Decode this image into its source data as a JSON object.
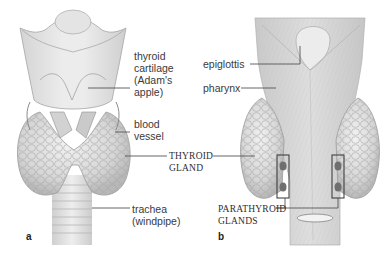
{
  "figure": {
    "panels": [
      {
        "id": "a",
        "letter": "a",
        "view": "anterior",
        "labels": {
          "thyroid_cartilage": "thyroid\ncartilage\n(Adam's\napple)",
          "blood_vessel": "blood\nvessel",
          "trachea": "trachea\n(windpipe)"
        }
      },
      {
        "id": "b",
        "letter": "b",
        "view": "posterior",
        "labels": {
          "epiglottis": "epiglottis",
          "pharynx": "pharynx",
          "parathyroid_glands": "PARATHYROID\nGLANDS"
        }
      }
    ],
    "shared_labels": {
      "thyroid_gland": "THYROID\nGLAND"
    },
    "colors": {
      "background": "#ffffff",
      "tissue_light": "#e6e6e6",
      "tissue_mid": "#cfcfcf",
      "tissue_dark": "#9a9a9a",
      "leader_line": "#555555",
      "text": "#3a3a3a"
    }
  }
}
